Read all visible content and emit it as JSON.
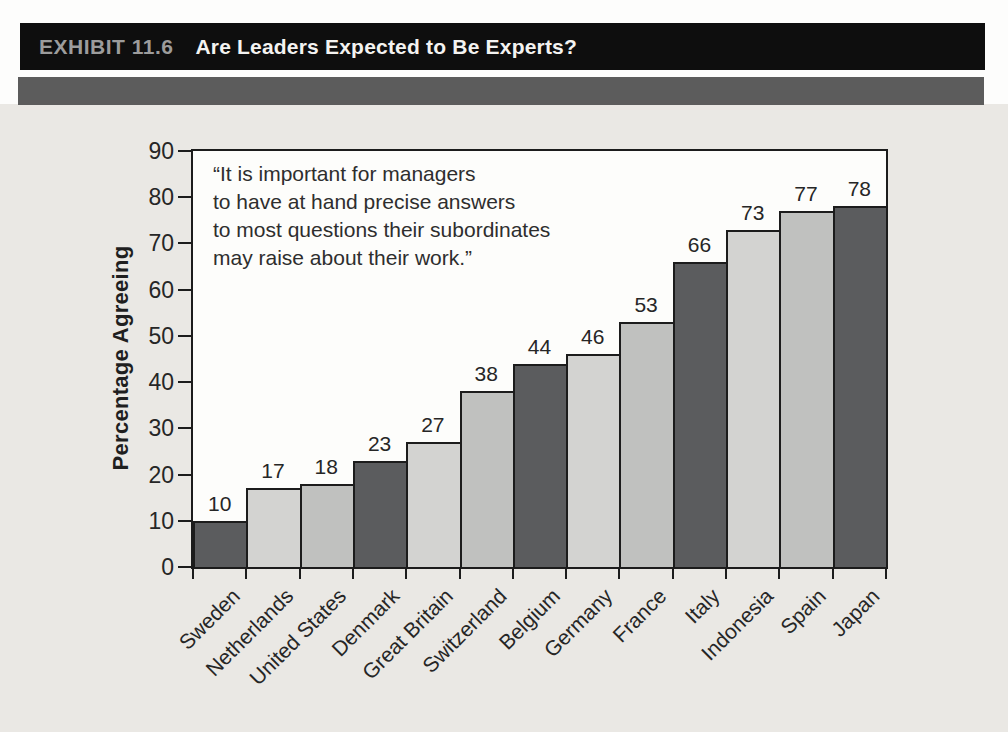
{
  "header": {
    "exhibit_label": "EXHIBIT 11.6",
    "title": "Are Leaders Expected to Be Experts?"
  },
  "chart_data": {
    "type": "bar",
    "categories": [
      "Sweden",
      "Netherlands",
      "United States",
      "Denmark",
      "Great Britain",
      "Switzerland",
      "Belgium",
      "Germany",
      "France",
      "Italy",
      "Indonesia",
      "Spain",
      "Japan"
    ],
    "values": [
      10,
      17,
      18,
      23,
      27,
      38,
      44,
      46,
      53,
      66,
      73,
      77,
      78
    ],
    "title": "Are Leaders Expected to Be Experts?",
    "xlabel": "",
    "ylabel": "Percentage Agreeing",
    "ylim": [
      0,
      90
    ],
    "yticks": [
      0,
      10,
      20,
      30,
      40,
      50,
      60,
      70,
      80,
      90
    ],
    "grid": false,
    "legend_position": "none",
    "annotation_lines": [
      "“It is important for managers",
      "to have at hand precise answers",
      "to most questions their subordinates",
      "may raise about their work.”"
    ],
    "bar_color_cycle": [
      "#5b5c5e",
      "#d3d3d1",
      "#c0c1bf"
    ]
  },
  "colors": {
    "page_background": "#eae8e4",
    "header_bar": "#0e0e0e",
    "header_label": "#9c9c9c",
    "header_title": "#f4f3f1",
    "rule_bar": "#5c5c5c",
    "plot_background": "#fdfdfb",
    "axis_line": "#1c1c1c",
    "text": "#262626"
  }
}
